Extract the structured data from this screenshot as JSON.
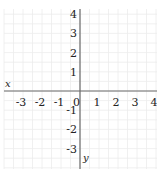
{
  "chart_data": {
    "type": "scatter",
    "title": "",
    "xlabel": "x",
    "ylabel": "y",
    "xlim": [
      -3.5,
      4.2
    ],
    "ylim": [
      -3.5,
      4.5
    ],
    "x_ticks": [
      -3,
      -2,
      -1,
      0,
      1,
      2,
      3,
      4
    ],
    "y_ticks": [
      4,
      3,
      2,
      1,
      -1,
      -2,
      -3
    ],
    "x_tick_labels": [
      "-3",
      "-2",
      "-1",
      "0",
      "1",
      "2",
      "3",
      "4"
    ],
    "y_tick_labels": [
      "4",
      "3",
      "2",
      "1",
      "-1",
      "-2",
      "-3"
    ],
    "grid": true,
    "series": [],
    "colors": {
      "axis": "#6b6b6b",
      "grid": "#ececec",
      "text": "#222222"
    }
  },
  "axes": {
    "x_label": "x",
    "y_label": "y"
  }
}
